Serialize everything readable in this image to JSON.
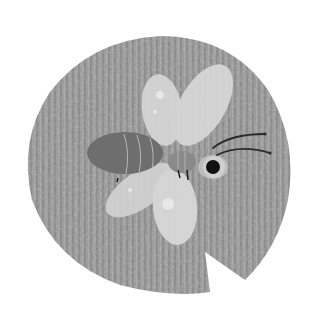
{
  "illustration": {
    "subject": "dragonfly on lily pad",
    "style": "grayscale textured illustration",
    "colors": {
      "background": "#ffffff",
      "lily_pad": "#9a9a9a",
      "lily_pad_texture": "#8a8a8a",
      "lily_pad_light": "#b0b0b0",
      "body": "#6e6e6e",
      "thorax": "#8a8a8a",
      "wings": "#d6d6d6",
      "wing_highlight": "#eeeeee",
      "eye_ring": "#cfcfcf",
      "eye": "#111111",
      "antennae": "#2a2a2a",
      "body_stripes": "#c8c8c8"
    }
  }
}
